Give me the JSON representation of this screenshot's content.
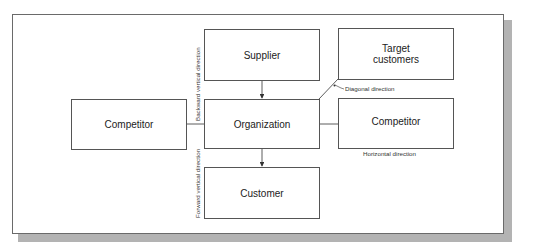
{
  "diagram": {
    "nodes": {
      "supplier": "Supplier",
      "target_customers": "Target customers",
      "competitor_left": "Competitor",
      "organization": "Organization",
      "competitor_right": "Competitor",
      "customer": "Customer"
    },
    "labels": {
      "backward": "Backward vertical direction",
      "forward": "Forward vertical direction",
      "diagonal": "Diagonal direction",
      "horizontal": "Horizontal direction"
    },
    "edges": [
      {
        "from": "supplier",
        "to": "organization",
        "arrow": true
      },
      {
        "from": "organization",
        "to": "customer",
        "arrow": true
      },
      {
        "from": "competitor_left",
        "to": "organization",
        "arrow": false
      },
      {
        "from": "organization",
        "to": "competitor_right",
        "arrow": false
      },
      {
        "from": "organization",
        "to": "target_customers",
        "arrow": false
      }
    ]
  }
}
